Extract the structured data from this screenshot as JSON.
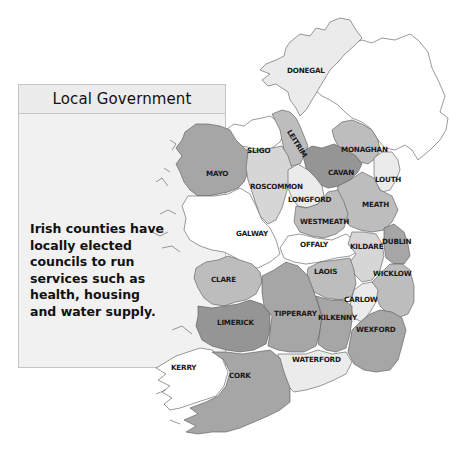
{
  "info_box": {
    "title": "Local Government",
    "body_lines": [
      "Irish counties have",
      "locally elected",
      "councils to run",
      "services such as",
      "health, housing",
      "and water supply."
    ]
  },
  "map": {
    "colors": {
      "white": "#ffffff",
      "very_light": "#ebebeb",
      "light": "#d6d6d6",
      "mid": "#bdbdbd",
      "dark": "#a6a6a6",
      "darker": "#959595",
      "outline": "#555555"
    },
    "counties": [
      {
        "name": "DONEGAL",
        "shade": "very_light"
      },
      {
        "name": "SLIGO",
        "shade": "white"
      },
      {
        "name": "LEITRIM",
        "shade": "mid"
      },
      {
        "name": "MONAGHAN",
        "shade": "mid"
      },
      {
        "name": "MAYO",
        "shade": "dark"
      },
      {
        "name": "CAVAN",
        "shade": "darker"
      },
      {
        "name": "LOUTH",
        "shade": "very_light"
      },
      {
        "name": "ROSCOMMON",
        "shade": "light"
      },
      {
        "name": "LONGFORD",
        "shade": "very_light"
      },
      {
        "name": "MEATH",
        "shade": "mid"
      },
      {
        "name": "WESTMEATH",
        "shade": "mid"
      },
      {
        "name": "GALWAY",
        "shade": "white"
      },
      {
        "name": "OFFALY",
        "shade": "white"
      },
      {
        "name": "KILDARE",
        "shade": "light"
      },
      {
        "name": "DUBLIN",
        "shade": "dark"
      },
      {
        "name": "CLARE",
        "shade": "mid"
      },
      {
        "name": "LAOIS",
        "shade": "mid"
      },
      {
        "name": "WICKLOW",
        "shade": "mid"
      },
      {
        "name": "CARLOW",
        "shade": "very_light"
      },
      {
        "name": "LIMERICK",
        "shade": "darker"
      },
      {
        "name": "TIPPERARY",
        "shade": "dark"
      },
      {
        "name": "KILKENNY",
        "shade": "dark"
      },
      {
        "name": "WEXFORD",
        "shade": "dark"
      },
      {
        "name": "KERRY",
        "shade": "white"
      },
      {
        "name": "WATERFORD",
        "shade": "very_light"
      },
      {
        "name": "CORK",
        "shade": "dark"
      }
    ]
  }
}
